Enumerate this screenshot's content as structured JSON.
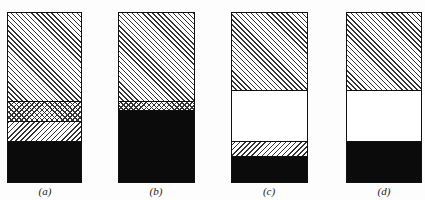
{
  "panels": [
    {
      "label": "(a)",
      "segments": [
        {
          "pattern": "diagonal-hatch",
          "height": 88
        },
        {
          "pattern": "cross-hatch",
          "height": 20
        },
        {
          "pattern": "reverse-diagonal-hatch",
          "height": 20
        },
        {
          "pattern": "solid-black",
          "height": 43
        }
      ]
    },
    {
      "label": "(b)",
      "segments": [
        {
          "pattern": "diagonal-hatch",
          "height": 88
        },
        {
          "pattern": "cross-hatch",
          "height": 9
        },
        {
          "pattern": "solid-black",
          "height": 74
        }
      ]
    },
    {
      "label": "(c)",
      "segments": [
        {
          "pattern": "diagonal-hatch",
          "height": 77
        },
        {
          "pattern": "blank",
          "height": 51
        },
        {
          "pattern": "reverse-diagonal-hatch",
          "height": 15
        },
        {
          "pattern": "solid-black",
          "height": 28
        }
      ]
    },
    {
      "label": "(d)",
      "segments": [
        {
          "pattern": "diagonal-hatch",
          "height": 77
        },
        {
          "pattern": "blank",
          "height": 51
        },
        {
          "pattern": "solid-black",
          "height": 43
        }
      ]
    }
  ],
  "colors": {
    "ink": "#111111",
    "fill": "#0b0b0b",
    "paper": "#fdfdfd"
  }
}
